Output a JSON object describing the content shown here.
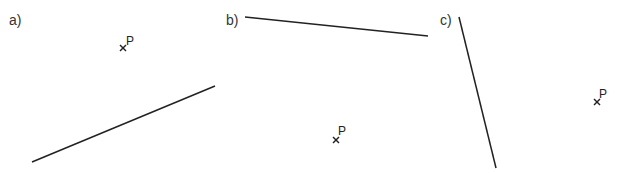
{
  "panels": [
    {
      "label": "a)",
      "label_pos": [
        9,
        13
      ],
      "line": {
        "x1": 32,
        "y1": 162,
        "x2": 215,
        "y2": 86
      },
      "point": {
        "name": "P",
        "x": 123,
        "y": 48,
        "label_pos": [
          126,
          35
        ]
      }
    },
    {
      "label": "b)",
      "label_pos": [
        226,
        13
      ],
      "line": {
        "x1": 245,
        "y1": 17,
        "x2": 428,
        "y2": 36
      },
      "point": {
        "name": "P",
        "x": 336,
        "y": 140,
        "label_pos": [
          338,
          125
        ]
      }
    },
    {
      "label": "c)",
      "label_pos": [
        440,
        13
      ],
      "line": {
        "x1": 459,
        "y1": 17,
        "x2": 496,
        "y2": 168
      },
      "point": {
        "name": "P",
        "x": 597,
        "y": 102,
        "label_pos": [
          599,
          88
        ]
      }
    }
  ],
  "colors": {
    "line": "#222222",
    "text": "#333333"
  }
}
